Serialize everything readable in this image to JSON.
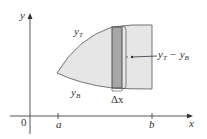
{
  "diagram": {
    "axes": {
      "x_label": "x",
      "y_label": "y",
      "origin_label": "0",
      "ticks": [
        {
          "label": "a",
          "x": 58
        },
        {
          "label": "b",
          "x": 152
        }
      ]
    },
    "curves": {
      "top": {
        "label": "y",
        "subscript": "T"
      },
      "bottom": {
        "label": "y",
        "subscript": "B"
      }
    },
    "strip": {
      "width_label": "Δx",
      "height_label_main": "y",
      "height_label_sub1": "T",
      "height_label_minus": " − y",
      "height_label_sub2": "B"
    },
    "colors": {
      "region_fill": "#e6e6e6",
      "strip_fill": "#a6a6a6",
      "outline": "#555555",
      "axis": "#444444"
    }
  }
}
